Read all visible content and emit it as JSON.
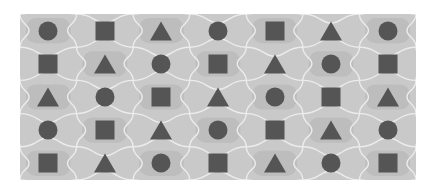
{
  "puzzle": {
    "rows": 5,
    "cols": 7,
    "colors": {
      "background": "#c9c9c9",
      "tile_alt": "#bdbdbd",
      "outline": "#ececec",
      "shape": "#555555"
    },
    "grid": [
      [
        "circle",
        "square",
        "triangle",
        "circle",
        "square",
        "triangle",
        "circle"
      ],
      [
        "square",
        "triangle",
        "circle",
        "square",
        "triangle",
        "circle",
        "square"
      ],
      [
        "triangle",
        "circle",
        "square",
        "triangle",
        "circle",
        "square",
        "triangle"
      ],
      [
        "circle",
        "square",
        "triangle",
        "circle",
        "square",
        "triangle",
        "circle"
      ],
      [
        "square",
        "triangle",
        "circle",
        "square",
        "triangle",
        "circle",
        "square"
      ]
    ]
  }
}
